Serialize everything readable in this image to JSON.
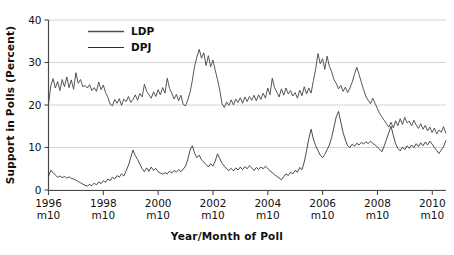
{
  "chart_data": {
    "type": "line",
    "title": "",
    "xlabel": "Year/Month of Poll",
    "ylabel": "Support in Polls (Percent)",
    "xlim": [
      1996.75,
      2011.25
    ],
    "ylim": [
      0,
      40
    ],
    "yticks": [
      0,
      10,
      20,
      30,
      40
    ],
    "ytick_labels": [
      "0",
      "10",
      "20",
      "30",
      "40"
    ],
    "xticks": [
      1996.75,
      1998.75,
      2000.75,
      2002.75,
      2004.75,
      2006.75,
      2008.75,
      2010.75
    ],
    "xtick_labels_top": [
      "1996",
      "1998",
      "2000",
      "2002",
      "2004",
      "2006",
      "2008",
      "2010"
    ],
    "xtick_labels_bottom": [
      "m10",
      "m10",
      "m10",
      "m10",
      "m10",
      "m10",
      "m10",
      "m10"
    ],
    "grid": true,
    "grid_axis": "y",
    "legend_position": "top-left-inside",
    "legend": [
      "LDP",
      "DPJ"
    ],
    "series": [
      {
        "name": "LDP",
        "color": "#4d4d4d",
        "x_start": 1996.75,
        "x_step": 0.0833,
        "values": [
          20.2,
          24.5,
          26.2,
          24.0,
          25.5,
          23.4,
          26.0,
          24.3,
          26.6,
          24.1,
          25.9,
          23.7,
          27.6,
          25.1,
          26.0,
          24.3,
          24.6,
          24.0,
          24.8,
          23.4,
          24.1,
          23.2,
          25.4,
          23.6,
          24.7,
          22.9,
          21.8,
          20.2,
          19.8,
          21.3,
          20.4,
          21.5,
          19.9,
          21.4,
          20.8,
          22.0,
          20.6,
          21.3,
          22.4,
          21.1,
          22.7,
          21.9,
          24.9,
          23.2,
          22.4,
          21.6,
          23.1,
          22.0,
          23.6,
          22.4,
          24.1,
          22.8,
          26.3,
          23.9,
          22.8,
          21.4,
          22.5,
          21.0,
          22.3,
          20.1,
          19.8,
          21.2,
          23.0,
          25.8,
          29.2,
          31.3,
          33.1,
          31.0,
          32.3,
          29.3,
          31.6,
          29.0,
          30.6,
          28.2,
          26.0,
          23.5,
          20.3,
          19.4,
          20.7,
          19.9,
          21.2,
          20.0,
          21.4,
          20.6,
          21.7,
          20.4,
          21.9,
          20.8,
          22.0,
          21.1,
          22.3,
          21.0,
          22.4,
          21.3,
          22.8,
          21.6,
          24.0,
          22.4,
          26.3,
          24.1,
          23.0,
          21.9,
          23.8,
          22.3,
          24.0,
          22.6,
          23.4,
          22.1,
          22.9,
          21.6,
          23.5,
          22.2,
          24.3,
          22.6,
          24.0,
          22.8,
          25.7,
          28.5,
          32.1,
          29.7,
          30.9,
          28.4,
          31.5,
          29.1,
          27.8,
          26.0,
          25.1,
          23.8,
          24.6,
          23.2,
          24.2,
          22.9,
          24.0,
          25.4,
          27.3,
          28.9,
          27.2,
          25.3,
          23.6,
          22.0,
          21.1,
          20.3,
          21.6,
          20.4,
          19.2,
          18.0,
          17.2,
          16.4,
          15.6,
          14.8,
          15.9,
          14.6,
          16.3,
          15.1,
          16.8,
          15.4,
          17.1,
          15.8,
          16.2,
          15.1,
          16.4,
          15.3,
          14.5,
          15.6,
          14.3,
          15.2,
          13.9,
          14.8,
          13.5,
          14.6,
          13.2,
          14.1,
          13.6,
          14.9,
          13.4,
          14.2,
          13.0,
          14.0,
          12.8,
          13.5,
          12.2,
          13.0,
          11.7,
          12.6,
          11.3,
          12.1,
          10.9,
          11.8,
          10.5,
          11.4,
          10.9,
          11.6,
          10.2,
          10.8,
          10.4,
          11.2
        ]
      },
      {
        "name": "DPJ",
        "color": "#2b2b2b",
        "x_start": 1996.75,
        "x_step": 0.0833,
        "values": [
          3.3,
          4.6,
          4.1,
          3.5,
          3.0,
          3.3,
          2.9,
          3.2,
          2.8,
          3.1,
          2.7,
          2.6,
          2.3,
          2.0,
          1.7,
          1.4,
          1.1,
          0.9,
          1.3,
          1.0,
          1.6,
          1.2,
          1.9,
          1.5,
          2.2,
          1.8,
          2.6,
          2.2,
          3.0,
          2.6,
          3.4,
          3.0,
          3.8,
          3.3,
          4.5,
          5.8,
          7.6,
          9.4,
          8.1,
          7.2,
          6.1,
          5.0,
          4.3,
          5.2,
          4.4,
          5.4,
          4.6,
          5.1,
          4.3,
          4.0,
          3.7,
          4.1,
          3.8,
          4.4,
          4.0,
          4.6,
          4.2,
          4.8,
          4.3,
          4.9,
          5.6,
          7.2,
          9.4,
          10.4,
          8.6,
          7.6,
          8.2,
          7.1,
          6.6,
          6.0,
          5.4,
          6.2,
          5.6,
          6.8,
          8.5,
          7.4,
          6.3,
          5.6,
          5.0,
          4.6,
          5.1,
          4.5,
          5.2,
          4.7,
          5.4,
          4.8,
          5.5,
          5.0,
          5.7,
          5.2,
          4.6,
          5.3,
          4.8,
          5.4,
          5.0,
          5.6,
          5.1,
          4.5,
          4.1,
          3.6,
          3.2,
          2.8,
          2.4,
          3.1,
          3.8,
          3.4,
          4.2,
          3.8,
          4.6,
          4.2,
          5.3,
          4.8,
          6.6,
          9.2,
          12.1,
          14.3,
          12.0,
          10.4,
          9.3,
          8.2,
          7.6,
          8.4,
          9.5,
          10.6,
          12.4,
          14.8,
          17.2,
          18.5,
          16.0,
          13.5,
          11.8,
          10.4,
          10.0,
          10.8,
          10.3,
          11.0,
          10.6,
          11.2,
          10.8,
          11.4,
          10.9,
          11.5,
          11.0,
          10.6,
          10.1,
          9.6,
          9.0,
          10.3,
          11.9,
          13.5,
          15.0,
          12.8,
          10.9,
          9.8,
          9.2,
          10.1,
          9.5,
          10.4,
          9.8,
          10.6,
          10.0,
          10.9,
          10.2,
          11.1,
          10.4,
          11.3,
          10.6,
          11.5,
          10.8,
          10.0,
          9.3,
          8.6,
          9.4,
          10.2,
          11.6,
          13.4,
          15.3,
          17.2,
          18.9,
          17.6,
          16.3,
          15.0,
          16.2,
          15.4,
          14.6,
          15.2,
          14.4,
          15.0,
          14.2,
          15.3,
          14.5,
          15.6,
          14.8,
          16.0,
          15.2,
          16.4,
          15.6,
          17.0,
          18.2,
          17.0,
          16.2,
          17.4,
          16.6,
          17.8,
          17.0,
          16.2,
          15.4,
          16.3,
          15.5,
          16.6,
          15.8,
          16.9,
          16.1,
          15.3,
          14.5,
          15.4,
          14.6,
          15.5,
          14.7,
          15.6,
          14.8,
          15.7,
          14.9,
          15.8,
          15.0,
          14.2,
          13.4,
          14.3,
          13.5,
          12.7,
          11.9,
          12.8,
          12.0,
          13.0,
          12.2,
          13.1,
          12.3,
          13.2,
          12.4,
          13.3
        ]
      }
    ]
  }
}
